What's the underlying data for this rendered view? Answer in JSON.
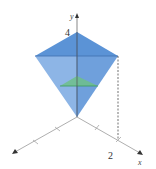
{
  "diagram": {
    "type": "3d-solid-cross-section",
    "axes": {
      "y_label": "y",
      "x_label": "x",
      "y_tick_label": "4",
      "x_tick_label": "2"
    },
    "colors": {
      "solid_fill": "#6fa3dc",
      "solid_face_light": "#9cc0e8",
      "solid_face_dark": "#4f88cc",
      "cross_section": "#6fc08a",
      "axis": "#888888"
    }
  }
}
